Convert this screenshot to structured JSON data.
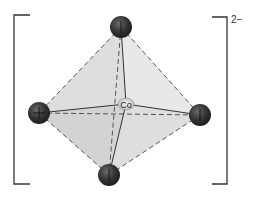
{
  "diagram": {
    "type": "octahedral complex ion",
    "center_atom": "Co",
    "charge": "2−",
    "ligand_count": 4,
    "colors": {
      "fill": "#dcdcdc",
      "atom": "#3a3a3a",
      "edge": "#444444",
      "bracket": "#333333"
    }
  }
}
